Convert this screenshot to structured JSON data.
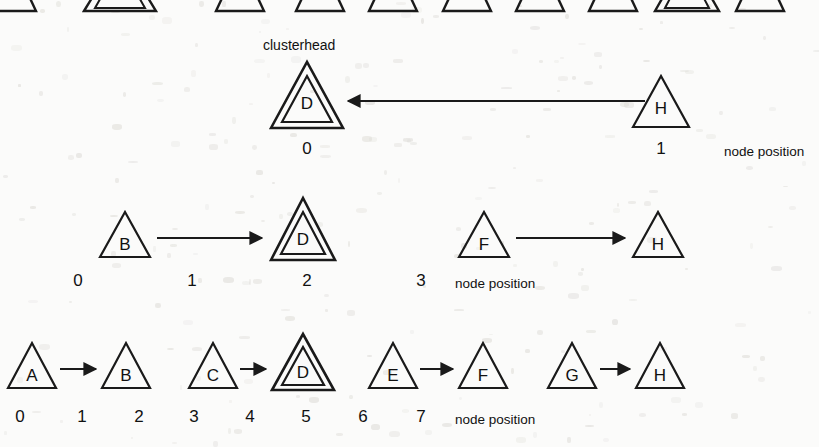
{
  "diagram": {
    "caption_clusterhead": "clusterhead",
    "axis_label": "node position",
    "colors": {
      "stroke": "#1a1a1a",
      "background": "#fbfbfa",
      "text": "#111111"
    }
  },
  "rows": [
    {
      "id": "row-partial-top",
      "cut_off": true,
      "axis_label": "",
      "nodes": [
        {
          "label": "",
          "position": "",
          "clusterhead": false,
          "x": 12
        },
        {
          "label": "",
          "position": "",
          "clusterhead": true,
          "x": 120
        },
        {
          "label": "",
          "position": "",
          "clusterhead": false,
          "x": 240
        },
        {
          "label": "",
          "position": "",
          "clusterhead": false,
          "x": 320
        },
        {
          "label": "",
          "position": "",
          "clusterhead": false,
          "x": 393
        },
        {
          "label": "",
          "position": "",
          "clusterhead": false,
          "x": 467
        },
        {
          "label": "",
          "position": "",
          "clusterhead": false,
          "x": 540
        },
        {
          "label": "",
          "position": "",
          "clusterhead": false,
          "x": 613
        },
        {
          "label": "",
          "position": "",
          "clusterhead": true,
          "x": 687
        },
        {
          "label": "",
          "position": "",
          "clusterhead": false,
          "x": 760
        }
      ],
      "arrows": []
    },
    {
      "id": "row-1",
      "cut_off": false,
      "axis_label": "node position",
      "nodes": [
        {
          "label": "D",
          "position": "0",
          "clusterhead": true,
          "x": 307
        },
        {
          "label": "H",
          "position": "1",
          "clusterhead": false,
          "x": 661
        }
      ],
      "arrows": [
        {
          "from": "H",
          "to": "D",
          "direction": "left"
        }
      ]
    },
    {
      "id": "row-2",
      "cut_off": false,
      "axis_label": "node position",
      "nodes": [
        {
          "label": "B",
          "position": "0",
          "clusterhead": false,
          "x": 125
        },
        {
          "label": "D",
          "position": "1",
          "clusterhead": true,
          "x": 303
        },
        {
          "label": "F",
          "position": "2",
          "clusterhead": false,
          "x": 484
        },
        {
          "label": "H",
          "position": "3",
          "clusterhead": false,
          "x": 658
        }
      ],
      "arrows": [
        {
          "from": "B",
          "to": "D",
          "direction": "right"
        },
        {
          "from": "F",
          "to": "H",
          "direction": "right"
        }
      ]
    },
    {
      "id": "row-3",
      "cut_off": false,
      "axis_label": "node position",
      "nodes": [
        {
          "label": "A",
          "position": "0",
          "clusterhead": false,
          "x": 32
        },
        {
          "label": "B",
          "position": "1",
          "clusterhead": false,
          "x": 126
        },
        {
          "label": "C",
          "position": "2",
          "clusterhead": false,
          "x": 213
        },
        {
          "label": "D",
          "position": "3",
          "clusterhead": true,
          "x": 303
        },
        {
          "label": "E",
          "position": "4",
          "clusterhead": false,
          "x": 393
        },
        {
          "label": "F",
          "position": "5",
          "clusterhead": false,
          "x": 483
        },
        {
          "label": "G",
          "position": "6",
          "clusterhead": false,
          "x": 572
        },
        {
          "label": "H",
          "position": "7",
          "clusterhead": false,
          "x": 660
        }
      ],
      "arrows": [
        {
          "from": "A",
          "to": "B",
          "direction": "right"
        },
        {
          "from": "C",
          "to": "D",
          "direction": "right"
        },
        {
          "from": "E",
          "to": "F",
          "direction": "right"
        },
        {
          "from": "G",
          "to": "H",
          "direction": "right"
        }
      ]
    }
  ],
  "labels": {
    "row1_positions": [
      "0",
      "1"
    ],
    "row2_positions": [
      "0",
      "1",
      "2",
      "3"
    ],
    "row3_positions": [
      "0",
      "1",
      "2",
      "3",
      "4",
      "5",
      "6",
      "7"
    ],
    "axis_text": "node position"
  }
}
